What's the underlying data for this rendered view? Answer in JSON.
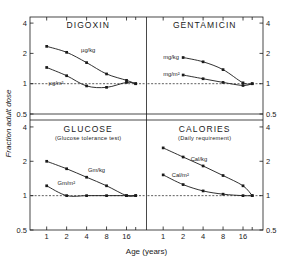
{
  "figure": {
    "y_axis_title": "Fraction adult dose",
    "x_axis_title": "Age (years)",
    "x_ticks": [
      "1",
      "2",
      "4",
      "8",
      "16"
    ],
    "y_ticks_upper": [
      "4",
      "2",
      "1",
      "0.5"
    ],
    "y_ticks_lower": [
      "4",
      "2",
      "1",
      "0.5"
    ]
  },
  "panels": {
    "digoxin": {
      "title": "DIGOXIN",
      "subtitle": "",
      "series": [
        {
          "name": "µg/kg",
          "label": "µg/kg"
        },
        {
          "name": "µg/m2",
          "label": "µg/m²"
        }
      ]
    },
    "gentamicin": {
      "title": "GENTAMICIN",
      "subtitle": "",
      "series": [
        {
          "name": "mg/kg",
          "label": "mg/kg"
        },
        {
          "name": "mg/m2",
          "label": "mg/m²"
        }
      ]
    },
    "glucose": {
      "title": "GLUCOSE",
      "subtitle": "(Glucose tolerance test)",
      "series": [
        {
          "name": "Gm/kg",
          "label": "Gm/kg"
        },
        {
          "name": "Gm/m2",
          "label": "Gm/m²"
        }
      ]
    },
    "calories": {
      "title": "CALORIES",
      "subtitle": "(Daily requirement)",
      "series": [
        {
          "name": "Cal/kg",
          "label": "Cal/kg"
        },
        {
          "name": "Cal/m2",
          "label": "Cal/m²"
        }
      ]
    }
  },
  "chart_data": [
    {
      "type": "line",
      "title": "DIGOXIN",
      "xlabel": "Age (years)",
      "ylabel": "Fraction adult dose",
      "xscale": "log",
      "yscale": "log",
      "xlim": [
        0.8,
        24
      ],
      "ylim": [
        0.5,
        4.5
      ],
      "grid": false,
      "reference_line_y": 1,
      "series": [
        {
          "name": "µg/kg",
          "x": [
            1,
            2,
            4,
            8,
            16,
            22
          ],
          "y": [
            2.35,
            2.05,
            1.62,
            1.25,
            1.08,
            1.0
          ]
        },
        {
          "name": "µg/m²",
          "x": [
            1,
            2,
            4,
            8,
            16,
            22
          ],
          "y": [
            1.45,
            1.2,
            0.95,
            0.92,
            1.03,
            1.0
          ]
        }
      ]
    },
    {
      "type": "line",
      "title": "GENTAMICIN",
      "xlabel": "Age (years)",
      "ylabel": "Fraction adult dose",
      "xscale": "log",
      "yscale": "log",
      "xlim": [
        0.8,
        24
      ],
      "ylim": [
        0.5,
        4.5
      ],
      "grid": false,
      "reference_line_y": 1,
      "series": [
        {
          "name": "mg/kg",
          "x": [
            2,
            4,
            8,
            16,
            22
          ],
          "y": [
            1.82,
            1.65,
            1.38,
            1.02,
            1.0
          ]
        },
        {
          "name": "mg/m²",
          "x": [
            2,
            4,
            8,
            16,
            22
          ],
          "y": [
            1.22,
            1.12,
            1.03,
            0.96,
            1.0
          ]
        }
      ]
    },
    {
      "type": "line",
      "title": "GLUCOSE",
      "subtitle": "(Glucose tolerance test)",
      "xlabel": "Age (years)",
      "ylabel": "Fraction adult dose",
      "xscale": "log",
      "yscale": "log",
      "xlim": [
        0.8,
        24
      ],
      "ylim": [
        0.5,
        4.5
      ],
      "grid": false,
      "reference_line_y": 1,
      "series": [
        {
          "name": "Gm/kg",
          "x": [
            1,
            2,
            4,
            8,
            16,
            22
          ],
          "y": [
            2.0,
            1.72,
            1.45,
            1.22,
            1.0,
            1.0
          ]
        },
        {
          "name": "Gm/m²",
          "x": [
            1,
            2,
            4,
            8,
            16,
            22
          ],
          "y": [
            1.22,
            1.0,
            1.0,
            1.0,
            1.0,
            1.0
          ]
        }
      ]
    },
    {
      "type": "line",
      "title": "CALORIES",
      "subtitle": "(Daily requirement)",
      "xlabel": "Age (years)",
      "ylabel": "Fraction adult dose",
      "xscale": "log",
      "yscale": "log",
      "xlim": [
        0.8,
        24
      ],
      "ylim": [
        0.5,
        4.5
      ],
      "grid": false,
      "reference_line_y": 1,
      "series": [
        {
          "name": "Cal/kg",
          "x": [
            1,
            2,
            4,
            8,
            16,
            22
          ],
          "y": [
            2.62,
            2.18,
            1.82,
            1.5,
            1.22,
            1.0
          ]
        },
        {
          "name": "Cal/m²",
          "x": [
            1,
            2,
            4,
            8,
            16,
            22
          ],
          "y": [
            1.52,
            1.25,
            1.1,
            1.03,
            1.0,
            1.0
          ]
        }
      ]
    }
  ]
}
